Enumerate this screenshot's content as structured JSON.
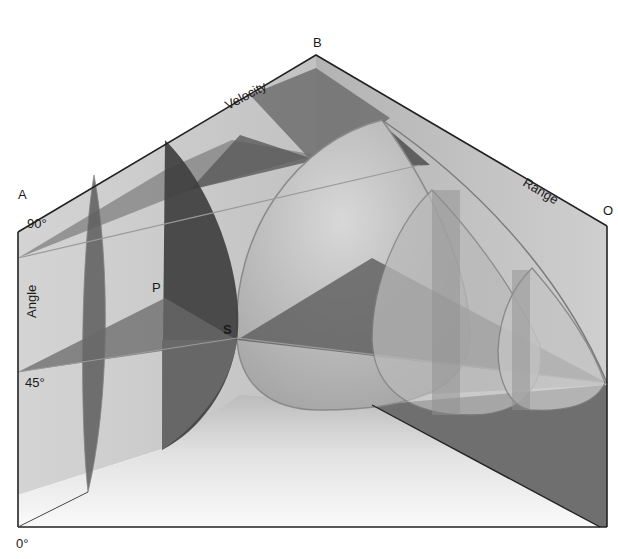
{
  "diagram": {
    "corners": {
      "A": "A",
      "B": "B",
      "O": "O"
    },
    "axes": {
      "velocity": "Velocity",
      "range": "Range",
      "angle": "Angle"
    },
    "angle_ticks": {
      "deg90": "90°",
      "deg45": "45°",
      "deg0": "0°"
    },
    "points": {
      "P": "P",
      "S": "S"
    },
    "colors": {
      "back_wall_left": "#c9c9c9",
      "back_wall_right": "#bdbdbd",
      "floor": "#efefef",
      "shadow": "#6f6f6f",
      "dark_band": "#4a4a4a",
      "mid_band": "#7d7d7d",
      "edge": "#222222"
    }
  }
}
